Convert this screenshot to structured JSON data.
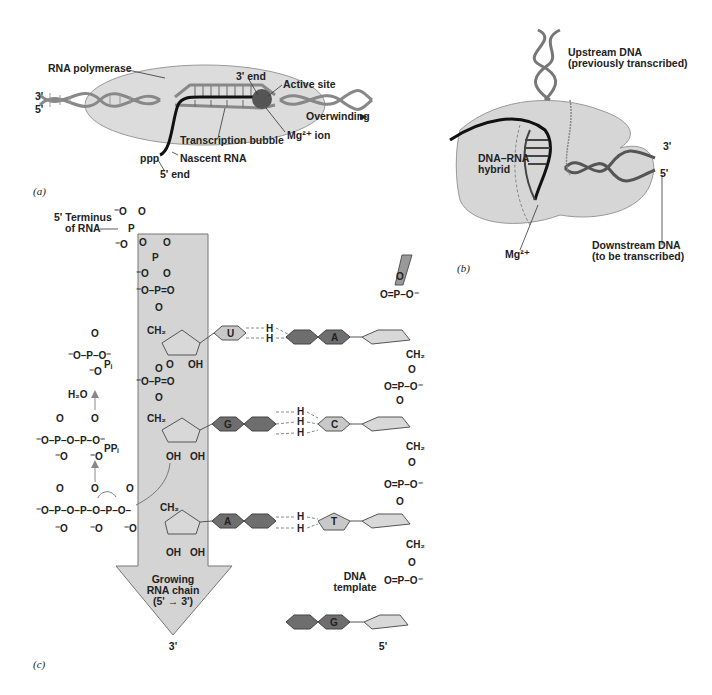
{
  "panels": {
    "a": {
      "label": "(a)",
      "strand_3": "3'",
      "strand_5": "5'",
      "rna_polymerase": "RNA polymerase",
      "three_end": "3' end",
      "active_site": "Active site",
      "overwinding": "Overwinding",
      "mg_ion": "Mg²⁺ ion",
      "transcription_bubble": "Transcription bubble",
      "ppp": "ppp",
      "nascent_rna": "Nascent RNA",
      "five_end": "5' end"
    },
    "b": {
      "label": "(b)",
      "upstream_line1": "Upstream DNA",
      "upstream_line2": "(previously transcribed)",
      "hybrid_line1": "DNA–RNA",
      "hybrid_line2": "hybrid",
      "three_prime": "3'",
      "five_prime": "5'",
      "mg": "Mg²⁺",
      "downstream_line1": "Downstream DNA",
      "downstream_line2": "(to be transcribed)"
    },
    "c": {
      "label": "(c)",
      "terminus_line1": "5' Terminus",
      "terminus_line2": "of RNA",
      "pi": "Pᵢ",
      "ppi": "PPᵢ",
      "water": "H₂O",
      "growing_line1": "Growing",
      "growing_line2": "RNA chain",
      "growing_line3": "(5' → 3')",
      "rna_3prime": "3'",
      "dna_template_line1": "DNA",
      "dna_template_line2": "template",
      "dna_5prime": "5'",
      "rna_bases": [
        "U",
        "G",
        "A"
      ],
      "dna_bases": [
        "A",
        "C",
        "T",
        "G"
      ],
      "ch2": "CH₂",
      "oh": "OH",
      "o": "O",
      "o_minus": "⁻O",
      "p": "P",
      "h": "H"
    }
  },
  "colors": {
    "protein": "#d9d9d9",
    "arrow_fill": "#d4d4d4",
    "purine_dark": "#6e6e6e",
    "pyrimidine_light": "#c8c8c8",
    "sugar": "#d8d8d8",
    "rna_strand": "#111111",
    "active_site": "#555555"
  }
}
